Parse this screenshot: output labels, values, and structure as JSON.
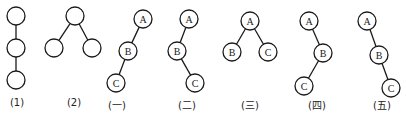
{
  "colors": {
    "stroke": "#1a1a1a",
    "background": "#ffffff"
  },
  "figures": [
    {
      "caption": "(1)",
      "caption_x": 17,
      "nodes": [
        {
          "id": "n1",
          "label": "",
          "x": 16,
          "y": 16
        },
        {
          "id": "n2",
          "label": "",
          "x": 16,
          "y": 48
        },
        {
          "id": "n3",
          "label": "",
          "x": 16,
          "y": 80
        }
      ],
      "edges": [
        [
          "n1",
          "n2"
        ],
        [
          "n2",
          "n3"
        ]
      ]
    },
    {
      "caption": "(2)",
      "caption_x": 74,
      "nodes": [
        {
          "id": "n1",
          "label": "",
          "x": 75,
          "y": 16
        },
        {
          "id": "n2",
          "label": "",
          "x": 54,
          "y": 48
        },
        {
          "id": "n3",
          "label": "",
          "x": 92,
          "y": 48
        }
      ],
      "edges": [
        [
          "n1",
          "n2"
        ],
        [
          "n1",
          "n3"
        ]
      ]
    },
    {
      "caption": "(一)",
      "caption_x": 117,
      "nodes": [
        {
          "id": "A",
          "label": "A",
          "x": 143,
          "y": 19
        },
        {
          "id": "B",
          "label": "B",
          "x": 128,
          "y": 51
        },
        {
          "id": "C",
          "label": "C",
          "x": 116,
          "y": 83
        }
      ],
      "edges": [
        [
          "A",
          "B"
        ],
        [
          "B",
          "C"
        ]
      ]
    },
    {
      "caption": "(二)",
      "caption_x": 187,
      "nodes": [
        {
          "id": "A",
          "label": "A",
          "x": 189,
          "y": 19
        },
        {
          "id": "B",
          "label": "B",
          "x": 177,
          "y": 51
        },
        {
          "id": "C",
          "label": "C",
          "x": 195,
          "y": 83
        }
      ],
      "edges": [
        [
          "A",
          "B"
        ],
        [
          "B",
          "C"
        ]
      ]
    },
    {
      "caption": "(三)",
      "caption_x": 250,
      "nodes": [
        {
          "id": "A",
          "label": "A",
          "x": 250,
          "y": 21
        },
        {
          "id": "B",
          "label": "B",
          "x": 232,
          "y": 52
        },
        {
          "id": "C",
          "label": "C",
          "x": 268,
          "y": 52
        }
      ],
      "edges": [
        [
          "A",
          "B"
        ],
        [
          "A",
          "C"
        ]
      ]
    },
    {
      "caption": "(四)",
      "caption_x": 317,
      "nodes": [
        {
          "id": "A",
          "label": "A",
          "x": 309,
          "y": 21
        },
        {
          "id": "B",
          "label": "B",
          "x": 323,
          "y": 53
        },
        {
          "id": "C",
          "label": "C",
          "x": 304,
          "y": 86
        }
      ],
      "edges": [
        [
          "A",
          "B"
        ],
        [
          "B",
          "C"
        ]
      ]
    },
    {
      "caption": "(五)",
      "caption_x": 382,
      "nodes": [
        {
          "id": "A",
          "label": "A",
          "x": 367,
          "y": 21
        },
        {
          "id": "B",
          "label": "B",
          "x": 379,
          "y": 55
        },
        {
          "id": "C",
          "label": "C",
          "x": 391,
          "y": 88
        }
      ],
      "edges": [
        [
          "A",
          "B"
        ],
        [
          "B",
          "C"
        ]
      ]
    }
  ],
  "node_radius": 9,
  "caption_y": 97
}
